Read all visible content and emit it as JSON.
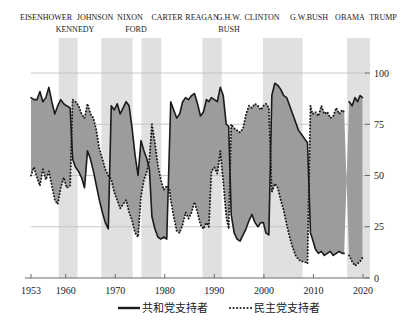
{
  "chart_data": {
    "type": "line",
    "title": "",
    "subtitle": "",
    "xlabel": "",
    "ylabel": "",
    "xlim": [
      1953,
      2020
    ],
    "ylim": [
      0,
      100
    ],
    "grid": true,
    "legend_position": "bottom",
    "yticks": [
      0,
      25,
      50,
      75,
      100
    ],
    "ytick_labels": [
      "0",
      "25",
      "50",
      "75",
      "100"
    ],
    "xticks": [
      1953,
      1960,
      1970,
      1980,
      1990,
      2000,
      2010,
      2020
    ],
    "xtick_labels": [
      "1953",
      "1960",
      "1970",
      "1980",
      "1990",
      "2000",
      "2010",
      "2020"
    ],
    "series": [
      {
        "name": "共和党支持者",
        "style": "solid",
        "color": "#1a1a1a",
        "points": [
          [
            1953,
            88
          ],
          [
            1953.6,
            87
          ],
          [
            1954.2,
            87
          ],
          [
            1954.8,
            91
          ],
          [
            1955.4,
            86
          ],
          [
            1956.0,
            88
          ],
          [
            1956.6,
            93
          ],
          [
            1957.2,
            86
          ],
          [
            1957.8,
            80
          ],
          [
            1958.4,
            84
          ],
          [
            1959.0,
            87
          ],
          [
            1959.6,
            85
          ],
          [
            1960.2,
            84
          ],
          [
            1960.9,
            83
          ],
          [
            1961.4,
            58
          ],
          [
            1962.0,
            54
          ],
          [
            1962.6,
            52
          ],
          [
            1963.2,
            49
          ],
          [
            1963.8,
            44
          ],
          [
            1964.4,
            62
          ],
          [
            1965.0,
            58
          ],
          [
            1965.6,
            52
          ],
          [
            1966.2,
            45
          ],
          [
            1966.8,
            38
          ],
          [
            1967.4,
            32
          ],
          [
            1968.0,
            27
          ],
          [
            1968.6,
            24
          ],
          [
            1969.2,
            84
          ],
          [
            1969.8,
            82
          ],
          [
            1970.4,
            85
          ],
          [
            1971.0,
            80
          ],
          [
            1971.6,
            83
          ],
          [
            1972.2,
            86
          ],
          [
            1972.8,
            84
          ],
          [
            1973.4,
            73
          ],
          [
            1974.0,
            60
          ],
          [
            1974.6,
            50
          ],
          [
            1975.2,
            67
          ],
          [
            1975.8,
            62
          ],
          [
            1976.4,
            58
          ],
          [
            1976.9,
            53
          ],
          [
            1977.4,
            30
          ],
          [
            1978.0,
            24
          ],
          [
            1978.6,
            20
          ],
          [
            1979.2,
            19
          ],
          [
            1979.8,
            20
          ],
          [
            1980.4,
            19
          ],
          [
            1981.2,
            86
          ],
          [
            1981.8,
            82
          ],
          [
            1982.4,
            78
          ],
          [
            1983.0,
            80
          ],
          [
            1983.6,
            86
          ],
          [
            1984.2,
            88
          ],
          [
            1984.8,
            87
          ],
          [
            1985.4,
            89
          ],
          [
            1986.0,
            90
          ],
          [
            1986.6,
            85
          ],
          [
            1987.2,
            79
          ],
          [
            1987.8,
            81
          ],
          [
            1988.4,
            87
          ],
          [
            1988.9,
            86
          ],
          [
            1989.4,
            88
          ],
          [
            1990.0,
            87
          ],
          [
            1990.6,
            86
          ],
          [
            1991.2,
            93
          ],
          [
            1991.8,
            89
          ],
          [
            1992.4,
            75
          ],
          [
            1992.9,
            74
          ],
          [
            1993.4,
            31
          ],
          [
            1994.0,
            22
          ],
          [
            1994.6,
            19
          ],
          [
            1995.2,
            18
          ],
          [
            1995.8,
            21
          ],
          [
            1996.4,
            24
          ],
          [
            1997.0,
            28
          ],
          [
            1997.6,
            31
          ],
          [
            1998.2,
            27
          ],
          [
            1998.8,
            25
          ],
          [
            1999.4,
            27
          ],
          [
            1999.9,
            27
          ],
          [
            2000.4,
            22
          ],
          [
            2001.0,
            21
          ],
          [
            2001.6,
            89
          ],
          [
            2002.2,
            95
          ],
          [
            2002.8,
            94
          ],
          [
            2003.4,
            92
          ],
          [
            2004.0,
            89
          ],
          [
            2004.6,
            88
          ],
          [
            2005.2,
            84
          ],
          [
            2005.8,
            80
          ],
          [
            2006.4,
            76
          ],
          [
            2007.0,
            72
          ],
          [
            2007.6,
            70
          ],
          [
            2008.2,
            68
          ],
          [
            2008.8,
            66
          ],
          [
            2009.4,
            22
          ],
          [
            2009.8,
            19
          ],
          [
            2010.4,
            14
          ],
          [
            2011.0,
            12
          ],
          [
            2011.6,
            13
          ],
          [
            2012.2,
            11
          ],
          [
            2012.8,
            12
          ],
          [
            2013.4,
            13
          ],
          [
            2014.0,
            11
          ],
          [
            2014.6,
            12
          ],
          [
            2015.2,
            13
          ],
          [
            2015.8,
            12
          ],
          [
            2016.2,
            12
          ],
          [
            2017.2,
            86
          ],
          [
            2017.8,
            84
          ],
          [
            2018.4,
            88
          ],
          [
            2018.9,
            86
          ],
          [
            2019.4,
            89
          ],
          [
            2019.9,
            88
          ]
        ]
      },
      {
        "name": "民主党支持者",
        "style": "dotted",
        "color": "#1a1a1a",
        "points": [
          [
            1953,
            50
          ],
          [
            1953.6,
            54
          ],
          [
            1954.2,
            49
          ],
          [
            1954.8,
            45
          ],
          [
            1955.4,
            53
          ],
          [
            1956.0,
            48
          ],
          [
            1956.6,
            52
          ],
          [
            1957.2,
            45
          ],
          [
            1957.8,
            38
          ],
          [
            1958.4,
            36
          ],
          [
            1959.0,
            44
          ],
          [
            1959.6,
            49
          ],
          [
            1960.2,
            44
          ],
          [
            1960.9,
            45
          ],
          [
            1961.4,
            87
          ],
          [
            1962.0,
            86
          ],
          [
            1962.6,
            84
          ],
          [
            1963.2,
            80
          ],
          [
            1963.8,
            78
          ],
          [
            1964.4,
            85
          ],
          [
            1965.0,
            80
          ],
          [
            1965.6,
            78
          ],
          [
            1966.2,
            72
          ],
          [
            1966.8,
            63
          ],
          [
            1967.4,
            58
          ],
          [
            1968.0,
            53
          ],
          [
            1968.6,
            50
          ],
          [
            1969.2,
            48
          ],
          [
            1969.8,
            42
          ],
          [
            1970.4,
            38
          ],
          [
            1971.0,
            34
          ],
          [
            1971.6,
            36
          ],
          [
            1972.2,
            38
          ],
          [
            1972.8,
            32
          ],
          [
            1973.4,
            28
          ],
          [
            1974.0,
            22
          ],
          [
            1974.6,
            20
          ],
          [
            1975.2,
            40
          ],
          [
            1975.8,
            48
          ],
          [
            1976.4,
            52
          ],
          [
            1976.9,
            58
          ],
          [
            1977.4,
            75
          ],
          [
            1978.0,
            66
          ],
          [
            1978.6,
            55
          ],
          [
            1979.2,
            48
          ],
          [
            1979.8,
            43
          ],
          [
            1980.4,
            45
          ],
          [
            1980.9,
            44
          ],
          [
            1981.2,
            38
          ],
          [
            1981.8,
            30
          ],
          [
            1982.4,
            23
          ],
          [
            1983.0,
            22
          ],
          [
            1983.6,
            26
          ],
          [
            1984.2,
            32
          ],
          [
            1984.8,
            29
          ],
          [
            1985.4,
            32
          ],
          [
            1986.0,
            37
          ],
          [
            1986.6,
            32
          ],
          [
            1987.2,
            26
          ],
          [
            1987.8,
            24
          ],
          [
            1988.4,
            27
          ],
          [
            1988.9,
            25
          ],
          [
            1989.4,
            52
          ],
          [
            1990.0,
            54
          ],
          [
            1990.6,
            51
          ],
          [
            1991.2,
            62
          ],
          [
            1991.8,
            47
          ],
          [
            1992.4,
            30
          ],
          [
            1992.9,
            24
          ],
          [
            1993.4,
            75
          ],
          [
            1994.0,
            73
          ],
          [
            1994.6,
            72
          ],
          [
            1995.2,
            71
          ],
          [
            1995.8,
            73
          ],
          [
            1996.4,
            80
          ],
          [
            1997.0,
            84
          ],
          [
            1997.6,
            83
          ],
          [
            1998.2,
            85
          ],
          [
            1998.8,
            84
          ],
          [
            1999.4,
            82
          ],
          [
            1999.9,
            84
          ],
          [
            2000.4,
            85
          ],
          [
            2001.0,
            83
          ],
          [
            2001.6,
            42
          ],
          [
            2002.2,
            46
          ],
          [
            2002.8,
            44
          ],
          [
            2003.4,
            38
          ],
          [
            2004.0,
            33
          ],
          [
            2004.6,
            26
          ],
          [
            2005.2,
            20
          ],
          [
            2005.8,
            15
          ],
          [
            2006.4,
            11
          ],
          [
            2007.0,
            9
          ],
          [
            2007.6,
            8
          ],
          [
            2008.2,
            8
          ],
          [
            2008.8,
            7
          ],
          [
            2009.4,
            84
          ],
          [
            2009.8,
            80
          ],
          [
            2010.4,
            81
          ],
          [
            2011.0,
            79
          ],
          [
            2011.6,
            84
          ],
          [
            2012.2,
            80
          ],
          [
            2012.8,
            81
          ],
          [
            2013.4,
            78
          ],
          [
            2014.0,
            79
          ],
          [
            2014.6,
            83
          ],
          [
            2015.2,
            80
          ],
          [
            2015.8,
            82
          ],
          [
            2016.2,
            81
          ],
          [
            2017.2,
            11
          ],
          [
            2017.8,
            8
          ],
          [
            2018.4,
            6
          ],
          [
            2018.9,
            7
          ],
          [
            2019.4,
            8
          ],
          [
            2019.9,
            10
          ]
        ]
      }
    ],
    "shaded_bands": [
      {
        "label": "recession-band-1",
        "x0": 1958.6,
        "x1": 1962.4
      },
      {
        "label": "recession-band-2",
        "x0": 1967.2,
        "x1": 1973.5
      },
      {
        "label": "recession-band-3",
        "x0": 1975.3,
        "x1": 1979.3
      },
      {
        "label": "recession-band-4",
        "x0": 1987.6,
        "x1": 1991.5
      },
      {
        "label": "recession-band-5",
        "x0": 1999.8,
        "x1": 2007.8
      },
      {
        "label": "recession-band-6",
        "x0": 2016.8,
        "x1": 2021.4
      }
    ]
  },
  "presidents": {
    "row_top": [
      {
        "name": "EISENHOWER",
        "x": 46
      },
      {
        "name": "JOHNSON",
        "x": 95
      },
      {
        "name": "NIXON",
        "x": 130
      },
      {
        "name": "CARTER",
        "x": 167
      },
      {
        "name": "REAGAN",
        "x": 202
      },
      {
        "name": "G.H.W.",
        "x": 229
      },
      {
        "name": "CLINTON",
        "x": 262
      },
      {
        "name": "G.W.BUSH",
        "x": 309
      },
      {
        "name": "OBAMA",
        "x": 350
      },
      {
        "name": "TRUMP",
        "x": 383
      }
    ],
    "row_bottom": [
      {
        "name": "KENNEDY",
        "x": 75
      },
      {
        "name": "FORD",
        "x": 136
      },
      {
        "name": "BUSH",
        "x": 229
      }
    ]
  },
  "legend": {
    "items": [
      {
        "label": "共和党支持者",
        "style": "solid"
      },
      {
        "label": "民主党支持者",
        "style": "dotted"
      }
    ]
  },
  "colors": {
    "line": "#1a1a1a",
    "band": "#e0e0e0",
    "fill": "#9c9c9c",
    "grid": "#bdbdbd",
    "axis": "#6a6a6a",
    "background": "#ffffff"
  }
}
